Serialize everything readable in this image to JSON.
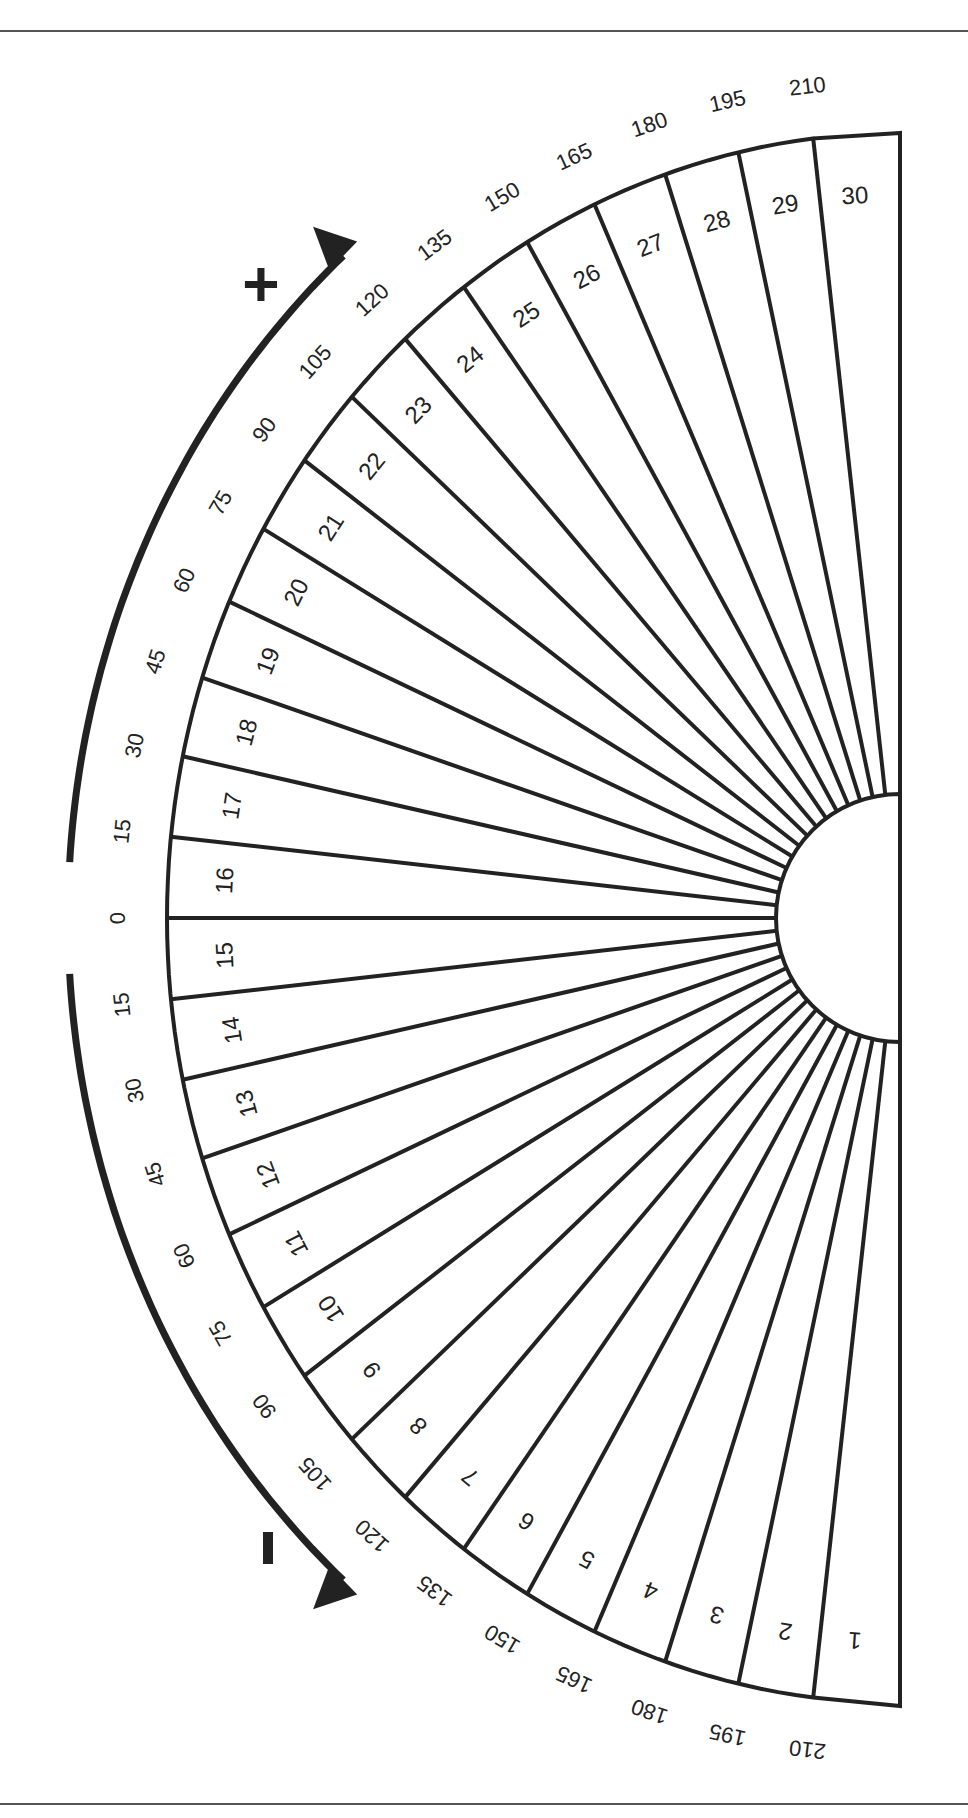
{
  "page": {
    "background": "#ffffff",
    "ink_color": "#222222",
    "rule_color": "#555555"
  },
  "chart_data": {
    "type": "radial-sector-chart",
    "title": "",
    "sector_count": 30,
    "sector_labels": [
      "1",
      "2",
      "3",
      "4",
      "5",
      "6",
      "7",
      "8",
      "9",
      "10",
      "11",
      "12",
      "13",
      "14",
      "15",
      "16",
      "17",
      "18",
      "19",
      "20",
      "21",
      "22",
      "23",
      "24",
      "25",
      "26",
      "27",
      "28",
      "29",
      "30"
    ],
    "scale_labels_upper": [
      "0",
      "15",
      "30",
      "45",
      "60",
      "75",
      "90",
      "105",
      "120",
      "135",
      "150",
      "165",
      "180",
      "195",
      "210"
    ],
    "scale_labels_lower": [
      "15",
      "30",
      "45",
      "60",
      "75",
      "90",
      "105",
      "120",
      "135",
      "150",
      "165",
      "180",
      "195",
      "210"
    ],
    "direction_indicators": {
      "plus": {
        "label": "+",
        "meaning": "upward arrow along outer arc"
      },
      "minus": {
        "label": "-",
        "meaning": "downward arrow along outer arc"
      }
    },
    "geometry": {
      "center": [
        900,
        918
      ],
      "inner_radius": 124,
      "outer_rx": 733,
      "outer_ry": 785,
      "right_edge_x": 900,
      "top_y": 133,
      "bottom_y": 1706
    }
  }
}
